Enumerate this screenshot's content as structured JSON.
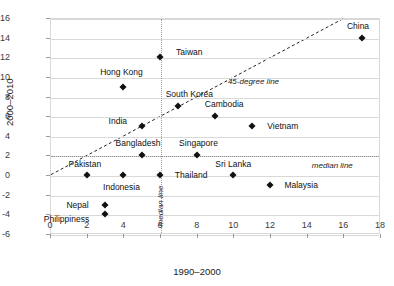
{
  "chart_data": {
    "type": "scatter",
    "title": "",
    "xlabel": "1990–2000",
    "ylabel": "2000–2010",
    "xlim": [
      0,
      18
    ],
    "ylim": [
      -6,
      16
    ],
    "xticks": [
      0,
      2,
      4,
      6,
      8,
      10,
      12,
      14,
      16,
      18
    ],
    "yticks": [
      -6,
      -4,
      -2,
      0,
      2,
      4,
      6,
      8,
      10,
      12,
      14,
      16
    ],
    "grid": "horizontal",
    "legend": "none",
    "points": [
      {
        "label": "China",
        "x": 17,
        "y": 14,
        "label_dx": -0.2,
        "label_dy": 1.2,
        "label_anchor": "center"
      },
      {
        "label": "Taiwan",
        "x": 6,
        "y": 12,
        "label_dx": 1.6,
        "label_dy": 0.55,
        "label_anchor": "center"
      },
      {
        "label": "Hong Kong",
        "x": 4,
        "y": 9,
        "label_dx": -0.1,
        "label_dy": 1.5,
        "label_anchor": "center"
      },
      {
        "label": "South Korea",
        "x": 7,
        "y": 7,
        "label_dx": 0.6,
        "label_dy": 1.3,
        "label_anchor": "center"
      },
      {
        "label": "Cambodia",
        "x": 9,
        "y": 6,
        "label_dx": 0.5,
        "label_dy": 1.2,
        "label_anchor": "center"
      },
      {
        "label": "Vietnam",
        "x": 11,
        "y": 5,
        "label_dx": 1.7,
        "label_dy": 0.0,
        "label_anchor": "center"
      },
      {
        "label": "India",
        "x": 5,
        "y": 5,
        "label_dx": -1.3,
        "label_dy": 0.5,
        "label_anchor": "center"
      },
      {
        "label": "Bangladesh",
        "x": 5,
        "y": 2,
        "label_dx": -0.2,
        "label_dy": 1.3,
        "label_anchor": "center"
      },
      {
        "label": "Singapore",
        "x": 8,
        "y": 2,
        "label_dx": 0.1,
        "label_dy": 1.3,
        "label_anchor": "center"
      },
      {
        "label": "Pakistan",
        "x": 2,
        "y": 0,
        "label_dx": -0.1,
        "label_dy": 1.1,
        "label_anchor": "center"
      },
      {
        "label": "Indonesia",
        "x": 4,
        "y": 0,
        "label_dx": -0.1,
        "label_dy": -1.2,
        "label_anchor": "center"
      },
      {
        "label": "Thailand",
        "x": 6,
        "y": 0,
        "label_dx": 1.7,
        "label_dy": 0.0,
        "label_anchor": "center"
      },
      {
        "label": "Sri Lanka",
        "x": 10,
        "y": 0,
        "label_dx": 0.0,
        "label_dy": 1.1,
        "label_anchor": "center"
      },
      {
        "label": "Malaysia",
        "x": 12,
        "y": -1,
        "label_dx": 1.7,
        "label_dy": 0.0,
        "label_anchor": "center"
      },
      {
        "label": "Nepal",
        "x": 3,
        "y": -3,
        "label_dx": -1.5,
        "label_dy": 0.0,
        "label_anchor": "center"
      },
      {
        "label": "Philippiness",
        "x": 3,
        "y": -4,
        "label_dx": -2.1,
        "label_dy": -0.5,
        "label_anchor": "center"
      }
    ],
    "reference_lines": [
      {
        "name": "45-degree line",
        "kind": "diagonal",
        "from": [
          0,
          0
        ],
        "to": [
          16,
          16
        ],
        "style": "dashed"
      },
      {
        "name": "median line",
        "kind": "vertical",
        "value": 6,
        "style": "dotted"
      },
      {
        "name": "median line",
        "kind": "horizontal",
        "value": 2,
        "style": "dotted"
      }
    ],
    "annotations": [
      {
        "text": "45-degree line",
        "x": 11.1,
        "y": 9.6,
        "orientation": "horizontal"
      },
      {
        "text": "median line",
        "x": 15.4,
        "y": 1.05,
        "orientation": "horizontal"
      },
      {
        "text": "median line",
        "x": 6,
        "y": -3.1,
        "orientation": "vertical"
      }
    ]
  }
}
